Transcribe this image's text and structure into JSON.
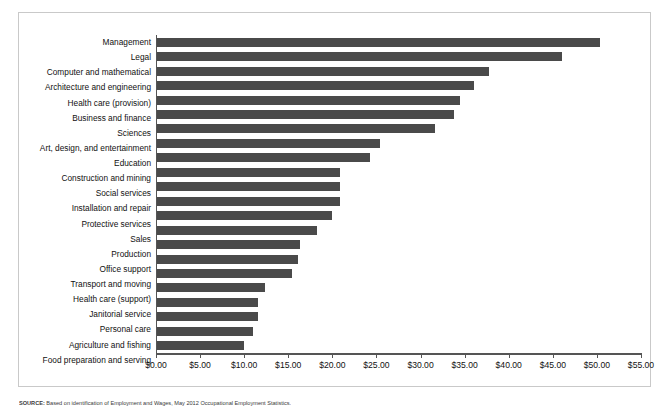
{
  "figure": {
    "source_prefix": "SOURCE:",
    "source_text": "Based on identification of Employment and Wages, May 2012 Occupational Employment Statistics."
  },
  "chart_data": {
    "type": "bar",
    "orientation": "horizontal",
    "title": "",
    "subtitle": "",
    "xlabel": "",
    "ylabel": "",
    "xlim": [
      0,
      55
    ],
    "grid": false,
    "legend": null,
    "bar_color": "#4a4a4a",
    "axis_color": "#555555",
    "value_prefix": "$",
    "value_format": "0.00",
    "xticks": [
      0,
      5,
      10,
      15,
      20,
      25,
      30,
      35,
      40,
      45,
      50,
      55
    ],
    "xticklabels": [
      "$0.00",
      "$5.00",
      "$10.00",
      "$15.00",
      "$20.00",
      "$25.00",
      "$30.00",
      "$35.00",
      "$40.00",
      "$45.00",
      "$50.00",
      "$55.00"
    ],
    "categories": [
      "Management",
      "Legal",
      "Computer and mathematical",
      "Architecture and engineering",
      "Health care (provision)",
      "Business and finance",
      "Sciences",
      "Art, design, and entertainment",
      "Education",
      "Construction and mining",
      "Social services",
      "Installation and repair",
      "Protective services",
      "Sales",
      "Production",
      "Office support",
      "Transport and moving",
      "Health care (support)",
      "Janitorial service",
      "Personal care",
      "Agriculture and fishing",
      "Food preparation and serving"
    ],
    "values": [
      50.2,
      45.9,
      37.7,
      36.0,
      34.4,
      33.7,
      31.5,
      25.3,
      24.2,
      20.8,
      20.7,
      20.7,
      19.8,
      18.2,
      16.2,
      16.0,
      15.3,
      12.3,
      11.5,
      11.4,
      10.9,
      9.9
    ]
  }
}
